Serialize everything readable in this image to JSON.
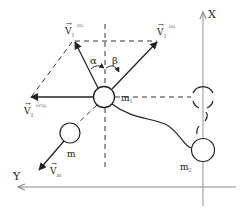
{
  "diagram": {
    "axes": {
      "x_label": "X",
      "y_label": "Y",
      "axis_color": "#999999"
    },
    "bodies": {
      "m1": {
        "label": "m",
        "sub": "1"
      },
      "m2": {
        "label": "m",
        "sub": "2"
      },
      "m": {
        "label": "m"
      }
    },
    "vectors": {
      "v_left_ini": {
        "label": "V",
        "sub": "1",
        "sup": "ini."
      },
      "v_right_ini": {
        "label": "V",
        "sub": "1",
        "sup": "ini."
      },
      "v_orig": {
        "label": "V",
        "sub": "1",
        "sup": "orig."
      },
      "v_m": {
        "label": "V",
        "sub": "m"
      }
    },
    "angles": {
      "alpha": "α",
      "beta": "β"
    },
    "colors": {
      "line": "#222222",
      "axis": "#9a9a9a",
      "dashed": "#333333"
    }
  }
}
